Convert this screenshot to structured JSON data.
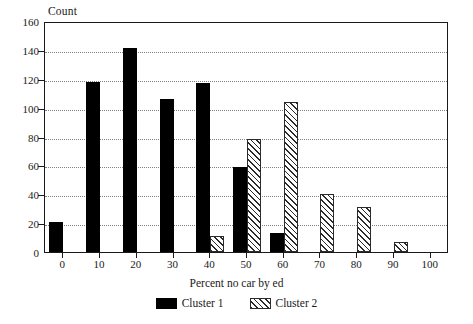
{
  "chart_data": {
    "type": "bar",
    "title": "",
    "xlabel": "Percent no car by ed",
    "ylabel": "Count",
    "categories": [
      "0",
      "10",
      "20",
      "30",
      "40",
      "50",
      "60",
      "70",
      "80",
      "90",
      "100"
    ],
    "x": [
      0,
      10,
      20,
      30,
      40,
      50,
      60,
      70,
      80,
      90,
      100
    ],
    "series": [
      {
        "name": "Cluster 1",
        "style": "solid-black",
        "color": "#000000",
        "values": [
          21,
          118,
          141,
          106,
          117,
          59,
          13,
          0,
          0,
          0,
          0
        ]
      },
      {
        "name": "Cluster 2",
        "style": "diagonal-hatch",
        "color": "#2b2b2b",
        "values": [
          0,
          0,
          0,
          0,
          11,
          78,
          104,
          40,
          31,
          7,
          0
        ]
      }
    ],
    "ylim": [
      0,
      160
    ],
    "ytick_values": [
      0,
      20,
      40,
      60,
      80,
      100,
      120,
      140,
      160
    ],
    "ytick_labels": [
      "0",
      "20",
      "40",
      "60",
      "80",
      "100",
      "120",
      "140",
      "160"
    ],
    "xlim": [
      -5,
      105
    ],
    "xtick_values": [
      0,
      10,
      20,
      30,
      40,
      50,
      60,
      70,
      80,
      90,
      100
    ],
    "xtick_labels": [
      "0",
      "10",
      "20",
      "30",
      "40",
      "50",
      "60",
      "70",
      "80",
      "90",
      "100"
    ],
    "grid": "horizontal-dotted",
    "legend_position": "bottom-center",
    "legend_entries": [
      "Cluster 1",
      "Cluster 2"
    ]
  },
  "axes": {
    "y_title": "Count",
    "x_title": "Percent no car by ed"
  },
  "legend": {
    "items": [
      {
        "label": "Cluster 1",
        "swatch": "solid-black-swatch"
      },
      {
        "label": "Cluster 2",
        "swatch": "hatched-swatch"
      }
    ]
  }
}
